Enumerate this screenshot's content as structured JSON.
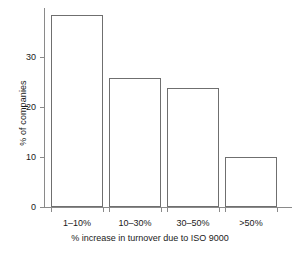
{
  "chart_data": {
    "type": "bar",
    "title": "",
    "xlabel": "% increase in turnover due to ISO 9000",
    "ylabel": "% of companies",
    "categories": [
      "1–10%",
      "10–30%",
      "30–50%",
      ">50%"
    ],
    "values": [
      38.5,
      26,
      24,
      10
    ],
    "ylim": [
      0,
      40
    ],
    "yticks": [
      0,
      10,
      20,
      30
    ],
    "ytick_labels": [
      "0",
      "10",
      "20",
      "30"
    ],
    "grid": false,
    "legend": "none",
    "bar_edge_color": "#6f6f6f",
    "bar_fill_color": "#ffffff",
    "axis_color": "#8a8a8a",
    "background_color": "#ffffff"
  },
  "axes": {
    "y_title": "% of companies",
    "x_title": "% increase in turnover due to ISO 9000",
    "y_labels": {
      "t0": "0",
      "t1": "10",
      "t2": "20",
      "t3": "30"
    },
    "x_labels": {
      "c0": "1–10%",
      "c1": "10–30%",
      "c2": "30–50%",
      "c3": ">50%"
    }
  }
}
